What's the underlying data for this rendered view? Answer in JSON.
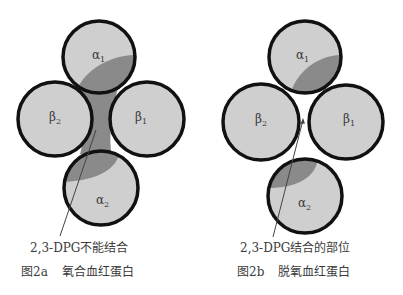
{
  "figure_a": {
    "subunits": {
      "alpha1": {
        "label": "α",
        "sub": "1"
      },
      "alpha2": {
        "label": "α",
        "sub": "2"
      },
      "beta1": {
        "label": "β",
        "sub": "1"
      },
      "beta2": {
        "label": "β",
        "sub": "2"
      }
    },
    "annotation": "2,3-DPG不能结合",
    "caption_num": "图2a",
    "caption_title": "氧合血红蛋白"
  },
  "figure_b": {
    "subunits": {
      "alpha1": {
        "label": "α",
        "sub": "1"
      },
      "alpha2": {
        "label": "α",
        "sub": "2"
      },
      "beta1": {
        "label": "β",
        "sub": "1"
      },
      "beta2": {
        "label": "β",
        "sub": "2"
      }
    },
    "annotation": "2,3-DPG结合的部位",
    "caption_num": "图2b",
    "caption_title": "脱氧血红蛋白"
  },
  "colors": {
    "subunit_fill": "#cfcfcf",
    "shaded_region": "#8a8a8a",
    "outline": "#111111",
    "text": "#3a3a3a"
  }
}
